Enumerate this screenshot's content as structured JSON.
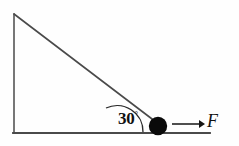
{
  "figure": {
    "type": "physics-free-body-diagram",
    "background_color": "#fefefe",
    "stroke_color": "#3a3a3a",
    "ink_color": "#111111"
  },
  "incline": {
    "name": "right-triangle-ramp",
    "apex": {
      "x": 14,
      "y": 14
    },
    "bottom_left": {
      "x": 14,
      "y": 133
    },
    "bottom_right": {
      "x": 210,
      "y": 133
    },
    "incline_foot": {
      "x": 154,
      "y": 120
    },
    "vertical_side_label": "",
    "base_label": "",
    "hypotenuse_label": ""
  },
  "angle": {
    "name": "incline-angle",
    "value": "30",
    "unit": "°",
    "text": "30°",
    "vertex": {
      "x": 117,
      "y": 133
    },
    "arc_radius": 26
  },
  "ball": {
    "name": "ball",
    "label": "",
    "center": {
      "x": 158,
      "y": 126
    },
    "radius": 9,
    "fill": "#0a0a0a"
  },
  "force": {
    "name": "applied-force",
    "label": "F",
    "direction": "right",
    "arrow_start": {
      "x": 172,
      "y": 124
    },
    "arrow_end": {
      "x": 203,
      "y": 124
    }
  },
  "ground": {
    "name": "ground-line",
    "start": {
      "x": 13,
      "y": 133
    },
    "end": {
      "x": 210,
      "y": 133
    }
  }
}
